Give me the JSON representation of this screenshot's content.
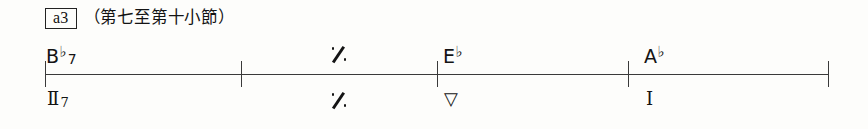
{
  "page": {
    "background_color": "#fdfdfb",
    "ink_color": "#141414"
  },
  "header": {
    "tag_label": "a3",
    "caption": "（第七至第十小節）"
  },
  "timeline": {
    "line_color": "#3a3a3a",
    "barline_ticks_x": [
      45,
      241,
      437,
      628,
      828
    ],
    "line_start_x": 45,
    "line_end_x": 828,
    "line_y": 74
  },
  "chords": [
    {
      "x": 46,
      "root": "B",
      "accidental": "♭",
      "extension": "7",
      "simile": false
    },
    {
      "x": 331,
      "root": "",
      "accidental": "",
      "extension": "",
      "simile": true,
      "symbol": "simile-repeat-mark"
    },
    {
      "x": 443,
      "root": "E",
      "accidental": "♭",
      "extension": "",
      "simile": false
    },
    {
      "x": 644,
      "root": "A",
      "accidental": "♭",
      "extension": "",
      "simile": false
    }
  ],
  "roman_numerals": [
    {
      "x": 47,
      "numeral": "Ⅱ",
      "subscript": "7",
      "simile": false
    },
    {
      "x": 331,
      "numeral": "",
      "subscript": "",
      "simile": true,
      "symbol": "simile-repeat-mark"
    },
    {
      "x": 444,
      "numeral": "▽",
      "subscript": "",
      "simile": false
    },
    {
      "x": 646,
      "numeral": "I",
      "subscript": "",
      "simile": false
    }
  ]
}
